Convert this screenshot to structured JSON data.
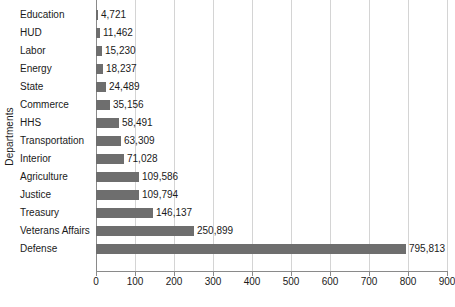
{
  "chart_data": {
    "type": "bar",
    "orientation": "horizontal",
    "title": "",
    "xlabel": "",
    "ylabel": "Departments",
    "xlim": [
      0,
      900
    ],
    "xtick_step": 100,
    "x_tick_labels": [
      "0",
      "100",
      "200",
      "300",
      "400",
      "500",
      "600",
      "700",
      "800",
      "900"
    ],
    "x_units_note": "values shown in thousands on axis; data labels are absolute",
    "grid": true,
    "legend": false,
    "bar_color": "#6e6e6e",
    "categories": [
      "Education",
      "HUD",
      "Labor",
      "Energy",
      "State",
      "Commerce",
      "HHS",
      "Transportation",
      "Interior",
      "Agriculture",
      "Justice",
      "Treasury",
      "Veterans Affairs",
      "Defense"
    ],
    "values": [
      4721,
      11462,
      15230,
      18237,
      24489,
      35156,
      58491,
      63309,
      71028,
      109586,
      109794,
      146137,
      250899,
      795813
    ],
    "value_labels": [
      "4,721",
      "11,462",
      "15,230",
      "18,237",
      "24,489",
      "35,156",
      "58,491",
      "63,309",
      "71,028",
      "109,586",
      "109,794",
      "146,137",
      "250,899",
      "795,813"
    ]
  }
}
